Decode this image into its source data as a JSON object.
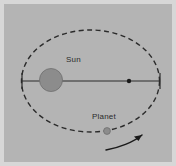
{
  "figure": {
    "background_color": "#b4b4b4",
    "outer_color": "#d7d7d7",
    "ink_color": "#2b2b2b"
  },
  "labels": {
    "sun": "Sun",
    "planet": "Planet"
  },
  "diagram": {
    "orbit": {
      "name": "orbit-ellipse",
      "style": "dashed",
      "center_x": 90.5,
      "center_y": 81,
      "radius_x": 69,
      "radius_y": 51,
      "stroke": "#2b2b2b",
      "stroke_width": 1.4,
      "dash_pattern": "5,3.5"
    },
    "major_axis": {
      "name": "major-axis-line",
      "x1": 22,
      "y1": 81,
      "x2": 160,
      "y2": 81,
      "stroke": "#2b2b2b",
      "stroke_width": 1
    },
    "sun": {
      "name": "sun-body",
      "center_x": 51,
      "center_y": 80,
      "radius": 11.5,
      "fill": "#8c8c8c",
      "stroke": "#6f6f6f"
    },
    "focus_point": {
      "name": "second-focus-point",
      "center_x": 129,
      "center_y": 81,
      "radius": 2.2,
      "fill": "#1a1a1a"
    },
    "planet": {
      "name": "planet-body",
      "center_x": 107,
      "center_y": 131,
      "radius": 3.4,
      "fill": "#8c8c8c",
      "stroke": "#6f6f6f"
    },
    "direction_arrow": {
      "name": "orbit-direction-arrow",
      "path": "M 106 150 C 118 148 134 142 142 135",
      "arrowhead": "M 142 135 L 134 136.5 L 138.5 141 Z",
      "stroke": "#1a1a1a",
      "stroke_width": 1.5
    },
    "apsis_ticks": [
      {
        "name": "perihelion-tick",
        "x": 22,
        "y1": 73,
        "y2": 89
      },
      {
        "name": "aphelion-tick",
        "x": 160,
        "y1": 73,
        "y2": 89
      }
    ]
  }
}
